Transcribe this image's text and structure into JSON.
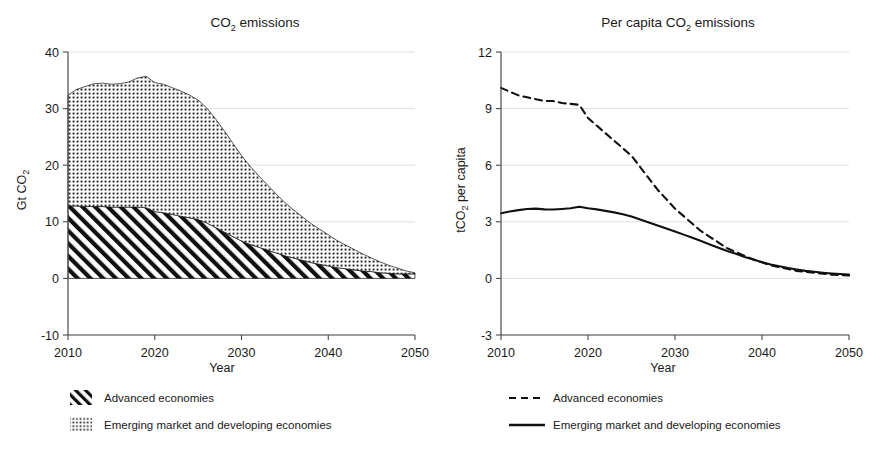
{
  "figure": {
    "panels": [
      {
        "id": "co2-emissions",
        "title_prefix": "CO",
        "title_sub": "2",
        "title_suffix": " emissions",
        "title_full": "CO2 emissions",
        "ylabel_prefix": "Gt CO",
        "ylabel_sub": "2",
        "ylabel_full": "Gt CO2",
        "xlabel": "Year",
        "legend": [
          {
            "label": "Advanced economies",
            "swatch": "hatch-diagonal-swatch"
          },
          {
            "label": "Emerging market and developing economies",
            "swatch": "dotted-swatch"
          }
        ]
      },
      {
        "id": "per-capita-co2-emissions",
        "title_prefix": "Per capita CO",
        "title_sub": "2",
        "title_suffix": " emissions",
        "title_full": "Per capita CO2 emissions",
        "ylabel_prefix": "tCO",
        "ylabel_sub": "2",
        "ylabel_suffix": " per capita",
        "ylabel_full": "tCO2 per capita",
        "xlabel": "Year",
        "legend": [
          {
            "label": "Advanced economies",
            "swatch": "dashed-line-swatch"
          },
          {
            "label": "Emerging market and developing economies",
            "swatch": "solid-line-swatch"
          }
        ]
      }
    ]
  },
  "chart_data": [
    {
      "type": "area",
      "stacked": true,
      "title": "CO2 emissions",
      "xlabel": "Year",
      "ylabel": "Gt CO2",
      "xlim": [
        2010,
        2050
      ],
      "ylim": [
        -10,
        40
      ],
      "yticks": [
        -10,
        0,
        10,
        20,
        30,
        40
      ],
      "xticks": [
        2010,
        2020,
        2030,
        2040,
        2050
      ],
      "grid": true,
      "legend_position": "below-left",
      "x": [
        2010,
        2011,
        2012,
        2013,
        2014,
        2015,
        2016,
        2017,
        2018,
        2019,
        2020,
        2021,
        2022,
        2023,
        2024,
        2025,
        2026,
        2027,
        2028,
        2029,
        2030,
        2031,
        2032,
        2033,
        2034,
        2035,
        2036,
        2037,
        2038,
        2039,
        2040,
        2041,
        2042,
        2043,
        2044,
        2045,
        2046,
        2047,
        2048,
        2049,
        2050
      ],
      "series": [
        {
          "name": "Advanced economies",
          "pattern": "diagonal-hatch",
          "values": [
            12.8,
            12.8,
            12.7,
            12.7,
            12.7,
            12.6,
            12.6,
            12.6,
            12.6,
            12.5,
            11.8,
            11.6,
            11.3,
            11.0,
            10.7,
            10.4,
            9.8,
            9.0,
            8.2,
            7.4,
            6.6,
            6.0,
            5.5,
            5.0,
            4.5,
            4.0,
            3.6,
            3.2,
            2.8,
            2.5,
            2.2,
            1.9,
            1.7,
            1.5,
            1.3,
            1.2,
            1.0,
            0.9,
            0.8,
            0.8,
            0.8
          ]
        },
        {
          "name": "Emerging market and developing economies",
          "pattern": "dotted",
          "values": [
            19.6,
            20.6,
            21.2,
            21.7,
            21.8,
            21.7,
            21.8,
            22.1,
            22.8,
            23.2,
            22.8,
            22.7,
            22.4,
            22.1,
            21.7,
            21.1,
            20.3,
            19.2,
            17.9,
            16.5,
            15.1,
            13.8,
            12.6,
            11.5,
            10.4,
            9.4,
            8.5,
            7.7,
            6.9,
            6.2,
            5.5,
            4.8,
            4.2,
            3.6,
            3.0,
            2.4,
            1.9,
            1.4,
            1.0,
            0.5,
            0.2
          ]
        }
      ],
      "totals": [
        32.4,
        33.4,
        33.9,
        34.4,
        34.5,
        34.3,
        34.4,
        34.7,
        35.4,
        35.7,
        34.6,
        34.3,
        33.7,
        33.1,
        32.4,
        31.5,
        30.1,
        28.2,
        26.1,
        23.9,
        21.7,
        19.8,
        18.1,
        16.5,
        14.9,
        13.4,
        12.1,
        10.9,
        9.7,
        8.7,
        7.7,
        6.7,
        5.9,
        5.1,
        4.3,
        3.6,
        2.9,
        2.3,
        1.8,
        1.3,
        1.0
      ]
    },
    {
      "type": "line",
      "title": "Per capita CO2 emissions",
      "xlabel": "Year",
      "ylabel": "tCO2 per capita",
      "xlim": [
        2010,
        2050
      ],
      "ylim": [
        -3,
        12
      ],
      "yticks": [
        -3,
        0,
        3,
        6,
        9,
        12
      ],
      "xticks": [
        2010,
        2020,
        2030,
        2040,
        2050
      ],
      "grid": true,
      "legend_position": "below-center",
      "x": [
        2010,
        2011,
        2012,
        2013,
        2014,
        2015,
        2016,
        2017,
        2018,
        2019,
        2020,
        2021,
        2022,
        2023,
        2024,
        2025,
        2026,
        2027,
        2028,
        2029,
        2030,
        2031,
        2032,
        2033,
        2034,
        2035,
        2036,
        2037,
        2038,
        2039,
        2040,
        2041,
        2042,
        2043,
        2044,
        2045,
        2046,
        2047,
        2048,
        2049,
        2050
      ],
      "series": [
        {
          "name": "Advanced economies",
          "style": "dashed",
          "values": [
            10.1,
            9.9,
            9.7,
            9.6,
            9.5,
            9.4,
            9.4,
            9.3,
            9.25,
            9.2,
            8.5,
            8.1,
            7.7,
            7.3,
            6.9,
            6.5,
            5.9,
            5.3,
            4.7,
            4.2,
            3.7,
            3.3,
            2.9,
            2.5,
            2.2,
            1.9,
            1.6,
            1.4,
            1.2,
            1.0,
            0.85,
            0.7,
            0.6,
            0.5,
            0.4,
            0.35,
            0.3,
            0.25,
            0.2,
            0.18,
            0.15
          ]
        },
        {
          "name": "Emerging market and developing economies",
          "style": "solid",
          "values": [
            3.45,
            3.55,
            3.62,
            3.68,
            3.7,
            3.66,
            3.65,
            3.68,
            3.72,
            3.8,
            3.72,
            3.66,
            3.58,
            3.5,
            3.4,
            3.28,
            3.12,
            2.96,
            2.8,
            2.64,
            2.48,
            2.32,
            2.15,
            1.98,
            1.8,
            1.62,
            1.45,
            1.3,
            1.14,
            1.0,
            0.86,
            0.74,
            0.64,
            0.55,
            0.47,
            0.4,
            0.35,
            0.3,
            0.26,
            0.23,
            0.2
          ]
        }
      ]
    }
  ]
}
